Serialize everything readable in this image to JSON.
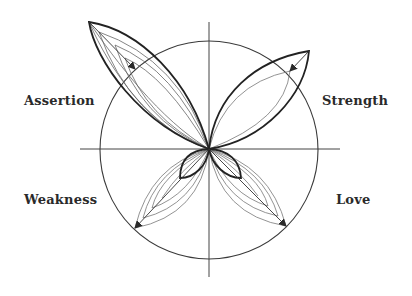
{
  "diagram": {
    "type": "polar-quadrant-butterfly",
    "labels": {
      "top_left": "Assertion",
      "top_right": "Strength",
      "bottom_left": "Weakness",
      "bottom_right": "Love"
    },
    "colors": {
      "ink": "#2a2a2a",
      "thin_line": "#555555",
      "background": "#ffffff"
    }
  }
}
